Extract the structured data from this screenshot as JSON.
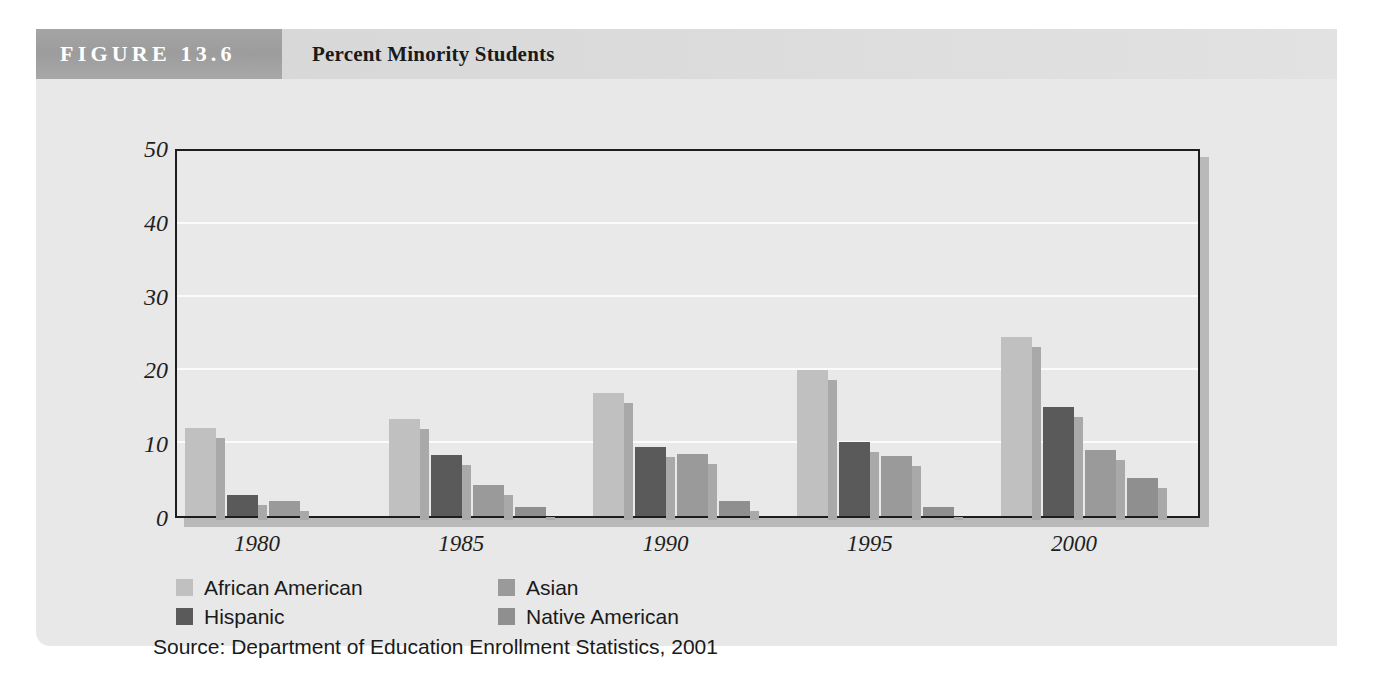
{
  "figure": {
    "number_label": "FIGURE 13.6",
    "title": "Percent Minority Students",
    "source_note": "Source: Department of Education Enrollment Statistics, 2001"
  },
  "colors": {
    "panel_background": "#e8e8e8",
    "header_block": "#9c9c9c",
    "header_band": "#dcdcdc",
    "plot_background": "#e9e9e9",
    "plot_border": "#1d1d1d",
    "gridline": "#fbfbfb",
    "bar_shadow": "#a9a9a9",
    "african_american": "#c0c0c0",
    "hispanic": "#5a5a5a",
    "asian": "#9a9a9a",
    "native_american": "#8f8f8f"
  },
  "chart_data": {
    "type": "bar",
    "title": "Percent Minority Students",
    "subtitle": "",
    "xlabel": "",
    "ylabel": "",
    "categories": [
      "1980",
      "1985",
      "1990",
      "1995",
      "2000"
    ],
    "ylim": [
      0,
      50
    ],
    "yticks": [
      0,
      10,
      20,
      30,
      40,
      50
    ],
    "ytick_labels": [
      "0",
      "10",
      "20",
      "30",
      "40",
      "50"
    ],
    "gridlines": [
      10,
      20,
      30,
      40
    ],
    "grid": true,
    "legend_position": "below-plot",
    "series": [
      {
        "name": "African American",
        "color": "#c0c0c0",
        "values": [
          12.0,
          13.3,
          16.8,
          20.0,
          24.5
        ]
      },
      {
        "name": "Hispanic",
        "color": "#5a5a5a",
        "values": [
          2.9,
          8.4,
          9.4,
          10.2,
          14.9
        ]
      },
      {
        "name": "Asian",
        "color": "#9a9a9a",
        "values": [
          2.0,
          4.3,
          8.5,
          8.2,
          9.0
        ]
      },
      {
        "name": "Native American",
        "color": "#8f8f8f",
        "values": [
          0.0,
          1.2,
          2.0,
          1.2,
          5.2
        ]
      }
    ]
  },
  "legend": {
    "entries": [
      {
        "label": "African American",
        "color": "#c0c0c0"
      },
      {
        "label": "Asian",
        "color": "#9a9a9a"
      },
      {
        "label": "Hispanic",
        "color": "#5a5a5a"
      },
      {
        "label": "Native American",
        "color": "#8f8f8f"
      }
    ]
  }
}
